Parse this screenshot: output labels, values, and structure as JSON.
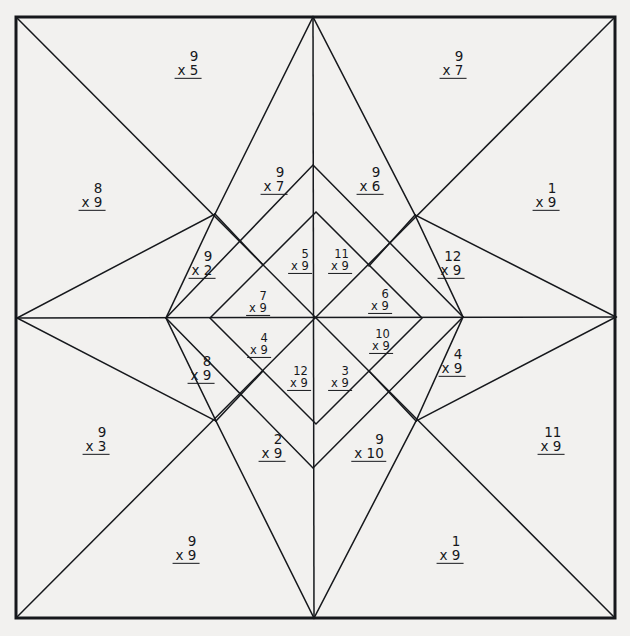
{
  "page": {
    "background_color": "#f2f1ef",
    "ink_color": "#16181c",
    "border": {
      "x": 15,
      "y": 16,
      "width": 601,
      "height": 603,
      "stroke_width": 3
    }
  },
  "geometry": {
    "center": [
      316,
      318
    ],
    "outer_points": {
      "top": [
        313,
        17
      ],
      "bottom": [
        314,
        618
      ],
      "left": [
        17,
        318
      ],
      "right": [
        616,
        317
      ],
      "top_left": [
        16,
        17
      ],
      "top_right": [
        615,
        17
      ],
      "bottom_left": [
        16,
        618
      ],
      "bottom_right": [
        615,
        618
      ]
    },
    "mid_ring": {
      "nw": [
        215,
        214
      ],
      "ne": [
        415,
        215
      ],
      "sw": [
        216,
        421
      ],
      "se": [
        416,
        421
      ]
    },
    "inner_diamond": {
      "top": [
        313,
        165
      ],
      "bottom": [
        313,
        468
      ],
      "left": [
        166,
        318
      ],
      "right": [
        463,
        317
      ]
    },
    "core_diamond": {
      "nw": [
        263,
        265
      ],
      "ne": [
        369,
        266
      ],
      "sw": [
        263,
        371
      ],
      "se": [
        369,
        371
      ]
    }
  },
  "problems": [
    {
      "id": "p-top-left-outer",
      "top": "9",
      "bottom": "x 5",
      "x": 188,
      "y": 64,
      "size": "sz-n"
    },
    {
      "id": "p-top-right-outer",
      "top": "9",
      "bottom": "x 7",
      "x": 453,
      "y": 64,
      "size": "sz-n"
    },
    {
      "id": "p-left-upper",
      "top": "8",
      "bottom": "x 9",
      "x": 92,
      "y": 196,
      "size": "sz-n"
    },
    {
      "id": "p-right-upper",
      "top": "1",
      "bottom": "x 9",
      "x": 546,
      "y": 196,
      "size": "sz-n"
    },
    {
      "id": "p-inner-top-left",
      "top": "9",
      "bottom": "x 7",
      "x": 274,
      "y": 180,
      "size": "sz-n"
    },
    {
      "id": "p-inner-top-right",
      "top": "9",
      "bottom": "x 6",
      "x": 370,
      "y": 180,
      "size": "sz-n"
    },
    {
      "id": "p-nw-wedge",
      "top": "9",
      "bottom": "x 2",
      "x": 202,
      "y": 264,
      "size": "sz-n"
    },
    {
      "id": "p-ne-wedge",
      "top": "12",
      "bottom": "x 9",
      "x": 451,
      "y": 264,
      "size": "sz-n"
    },
    {
      "id": "p-core-upper-left",
      "top": "5",
      "bottom": "x 9",
      "x": 300,
      "y": 261,
      "size": "sz-s"
    },
    {
      "id": "p-core-upper-right",
      "top": "11",
      "bottom": "x 9",
      "x": 340,
      "y": 261,
      "size": "sz-s"
    },
    {
      "id": "p-core-left-upper",
      "top": "7",
      "bottom": "x 9",
      "x": 258,
      "y": 303,
      "size": "sz-s"
    },
    {
      "id": "p-core-right-upper",
      "top": "6",
      "bottom": "x 9",
      "x": 380,
      "y": 301,
      "size": "sz-s"
    },
    {
      "id": "p-core-left-lower",
      "top": "4",
      "bottom": "x 9",
      "x": 259,
      "y": 345,
      "size": "sz-s"
    },
    {
      "id": "p-core-right-lower",
      "top": "10",
      "bottom": "x 9",
      "x": 381,
      "y": 341,
      "size": "sz-s"
    },
    {
      "id": "p-core-lower-left",
      "top": "12",
      "bottom": "x 9",
      "x": 299,
      "y": 378,
      "size": "sz-s"
    },
    {
      "id": "p-core-lower-right",
      "top": "3",
      "bottom": "x 9",
      "x": 340,
      "y": 378,
      "size": "sz-s"
    },
    {
      "id": "p-sw-wedge",
      "top": "8",
      "bottom": "x 9",
      "x": 201,
      "y": 369,
      "size": "sz-n"
    },
    {
      "id": "p-se-wedge",
      "top": "4",
      "bottom": "x 9",
      "x": 452,
      "y": 362,
      "size": "sz-n"
    },
    {
      "id": "p-inner-bot-left",
      "top": "2",
      "bottom": "x 9",
      "x": 272,
      "y": 447,
      "size": "sz-n"
    },
    {
      "id": "p-inner-bot-right",
      "top": "9",
      "bottom": "x 10",
      "x": 369,
      "y": 447,
      "size": "sz-n"
    },
    {
      "id": "p-left-lower",
      "top": "9",
      "bottom": "x 3",
      "x": 96,
      "y": 440,
      "size": "sz-n"
    },
    {
      "id": "p-right-lower",
      "top": "11",
      "bottom": "x 9",
      "x": 551,
      "y": 440,
      "size": "sz-n"
    },
    {
      "id": "p-bottom-left-outer",
      "top": "9",
      "bottom": "x 9",
      "x": 186,
      "y": 549,
      "size": "sz-n"
    },
    {
      "id": "p-bottom-right-outer",
      "top": "1",
      "bottom": "x 9",
      "x": 450,
      "y": 549,
      "size": "sz-n"
    }
  ],
  "lines": [
    {
      "name": "border-rect"
    },
    {
      "name": "diag-tl-to-center"
    },
    {
      "name": "diag-tr-to-center"
    },
    {
      "name": "diag-bl-to-center"
    },
    {
      "name": "diag-br-to-center"
    },
    {
      "name": "star-spike-top"
    },
    {
      "name": "star-spike-bottom"
    },
    {
      "name": "star-spike-left"
    },
    {
      "name": "star-spike-right"
    },
    {
      "name": "inner-diamond"
    },
    {
      "name": "core-diamond"
    },
    {
      "name": "axis-vertical"
    },
    {
      "name": "axis-horizontal"
    }
  ]
}
